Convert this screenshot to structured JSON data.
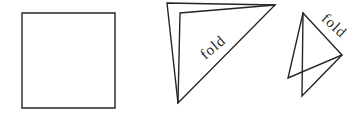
{
  "diagram": {
    "background": "#ffffff",
    "stroke_color": "#262626",
    "square": {
      "points": "22,13 115,13 115,108 22,108"
    },
    "first_fold": {
      "outline_points": "167,3 275,5 178,103",
      "layer_edge_points": "275,5 180,13 178,103",
      "label": "fold",
      "label_transform": "translate(216,51) rotate(-40)"
    },
    "second_fold": {
      "outline_points": "303,13 288,78 342,55",
      "layer_edge_points": "303,13 302,96 342,55",
      "label": "fold",
      "label_transform": "translate(331,29) rotate(43)"
    }
  }
}
